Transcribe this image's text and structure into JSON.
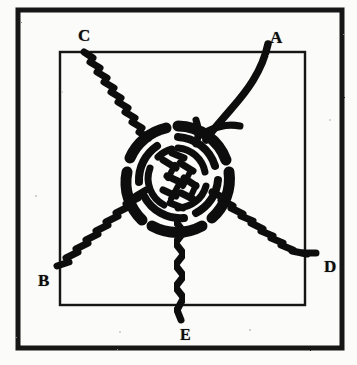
{
  "figure": {
    "background_color": "#fbfbf9",
    "ink_color": "#111111",
    "outer_frame": {
      "x": 18,
      "y": 10,
      "width": 324,
      "height": 338,
      "stroke": 5
    },
    "inner_frame": {
      "x": 60,
      "y": 52,
      "width": 245,
      "height": 253,
      "stroke": 2
    }
  },
  "labels": {
    "a": "A",
    "b": "B",
    "c": "C",
    "d": "D",
    "e": "E"
  },
  "knot": {
    "type": "woven-hub-knot",
    "center_x": 178,
    "center_y": 178,
    "outer_radius": 52,
    "ring_radii": [
      52,
      42,
      31,
      20
    ],
    "description": "Central woven rope ball with concentric rings"
  },
  "strands": [
    {
      "id": "A",
      "label": "A",
      "style": "solid-smooth",
      "from": "knot-center",
      "to": "top-right",
      "end_x": 268,
      "end_y": 44
    },
    {
      "id": "B",
      "label": "B",
      "style": "twisted",
      "from": "knot-center",
      "to": "bottom-left",
      "end_x": 56,
      "end_y": 268
    },
    {
      "id": "C",
      "label": "C",
      "style": "twisted",
      "from": "knot-center",
      "to": "top-left",
      "end_x": 82,
      "end_y": 50
    },
    {
      "id": "D",
      "label": "D",
      "style": "twisted",
      "from": "knot-center",
      "to": "bottom-right",
      "end_x": 314,
      "end_y": 254
    },
    {
      "id": "E",
      "label": "E",
      "style": "twisted",
      "from": "knot-center",
      "to": "bottom",
      "end_x": 180,
      "end_y": 322
    },
    {
      "id": "tail",
      "label": "",
      "style": "solid-stub",
      "from": "knot-center",
      "to": "right-stub",
      "end_x": 237,
      "end_y": 126
    }
  ]
}
